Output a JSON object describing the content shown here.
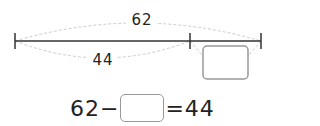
{
  "diagram": {
    "total_label": "62",
    "part_label": "44",
    "unknown_box": ""
  },
  "equation": {
    "left": "62",
    "operator": "−",
    "blank": "",
    "equals_rhs": "=44"
  }
}
